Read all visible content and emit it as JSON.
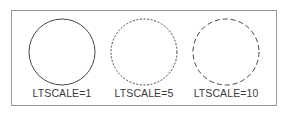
{
  "figure": {
    "background_color": "#ffffff",
    "border_color": "#9a9a9a",
    "stroke_color": "#444444",
    "text_color": "#3a3a3a",
    "panels": [
      {
        "id": "panel-ltscale-1",
        "caption": "LTSCALE=1",
        "linetype": "continuous",
        "dash_pattern": "none",
        "scale_value": 1
      },
      {
        "id": "panel-ltscale-5",
        "caption": "LTSCALE=5",
        "linetype": "dashed-fine",
        "dash_pattern": "2 1.6",
        "scale_value": 5
      },
      {
        "id": "panel-ltscale-10",
        "caption": "LTSCALE=10",
        "linetype": "dashed-coarse",
        "dash_pattern": "5 3",
        "scale_value": 10
      }
    ]
  }
}
